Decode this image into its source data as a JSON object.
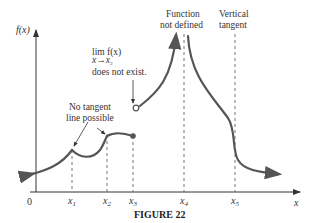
{
  "figure": {
    "caption": "FIGURE 22",
    "y_axis_label": "f(x)",
    "x_axis_label": "x",
    "origin_label": "0",
    "x_ticks": [
      {
        "name": "x",
        "sub": "1"
      },
      {
        "name": "x",
        "sub": "2"
      },
      {
        "name": "x",
        "sub": "3"
      },
      {
        "name": "x",
        "sub": "4"
      },
      {
        "name": "x",
        "sub": "5"
      }
    ],
    "annotations": {
      "limit_line1": "lim f(x)",
      "limit_sub": "x→x",
      "limit_sub_index": "3",
      "limit_line3": "does not exist.",
      "no_tangent_line1": "No tangent",
      "no_tangent_line2": "line possible",
      "undefined_line1": "Function",
      "undefined_line2": "not defined",
      "vertical_line1": "Vertical",
      "vertical_line2": "tangent"
    },
    "colors": {
      "curve": "#555555",
      "axis": "#333333",
      "dashed": "#666666"
    }
  }
}
